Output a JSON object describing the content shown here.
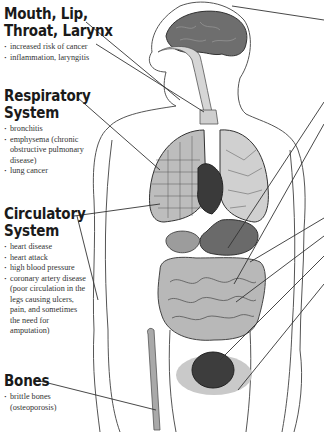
{
  "sections": [
    {
      "id": "mouth",
      "heading_line1": "Mouth, Lip,",
      "heading_line2": "Throat, Larynx",
      "items": [
        "increased risk of cancer",
        "inflammation, laryngitis"
      ]
    },
    {
      "id": "respiratory",
      "heading_line1": "Respiratory",
      "heading_line2": "System",
      "items": [
        "bronchitis",
        "emphysema (chronic obstructive pulmonary disease)",
        "lung cancer"
      ]
    },
    {
      "id": "circulatory",
      "heading_line1": "Circulatory",
      "heading_line2": "System",
      "items": [
        "heart disease",
        "heart attack",
        "high blood pressure",
        "coronary artery disease (poor circulation in the legs causing ulcers, pain, and sometimes the need for amputation)"
      ]
    },
    {
      "id": "bones",
      "heading_line1": "Bones",
      "heading_line2": "",
      "items": [
        "brittle bones (osteoporosis)"
      ]
    }
  ],
  "organs": [
    "brain",
    "throat",
    "lungs",
    "heart",
    "stomach",
    "intestines",
    "bladder",
    "bones",
    "blood vessels"
  ],
  "colors": {
    "outline": "#555555",
    "brain": "#6e6e6e",
    "heart": "#3a3a3a",
    "stomach": "#6a6a6a",
    "intestines": "#b8b8b8",
    "bladder": "#3d3d3d",
    "pelvis_shade": "#c9c9c9",
    "airway": "#d6d6d6"
  }
}
